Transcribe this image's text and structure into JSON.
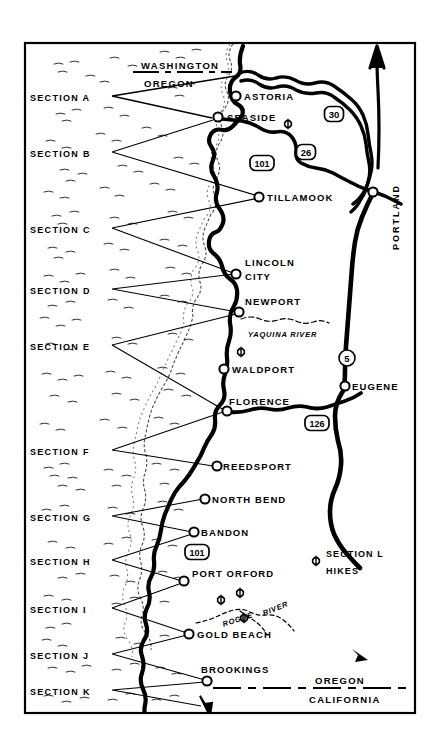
{
  "map": {
    "title": "Oregon Coast Trail Section Map",
    "region": "Oregon Coast",
    "frame": {
      "x": 25,
      "y": 43,
      "width": 390,
      "height": 670
    },
    "colors": {
      "land": "#ffffff",
      "ocean": "#ffffff",
      "highway": "#000000",
      "frame": "#000000",
      "text": "#000000"
    }
  },
  "sections": [
    {
      "id": "A",
      "label": "SECTION A",
      "x": 30,
      "y": 99,
      "leader_to": [
        [
          235,
          76
        ],
        [
          212,
          118
        ]
      ]
    },
    {
      "id": "B",
      "label": "SECTION B",
      "x": 30,
      "y": 155,
      "leader_to": [
        [
          213,
          120
        ],
        [
          258,
          196
        ]
      ]
    },
    {
      "id": "C",
      "label": "SECTION C",
      "x": 30,
      "y": 231,
      "leader_to": [
        [
          259,
          198
        ],
        [
          233,
          273
        ]
      ]
    },
    {
      "id": "D",
      "label": "SECTION D",
      "x": 30,
      "y": 292,
      "leader_to": [
        [
          234,
          274
        ],
        [
          237,
          312
        ]
      ]
    },
    {
      "id": "E",
      "label": "SECTION E",
      "x": 30,
      "y": 348,
      "leader_to": [
        [
          236,
          314
        ],
        [
          224,
          410
        ]
      ]
    },
    {
      "id": "F",
      "label": "SECTION F",
      "x": 30,
      "y": 453,
      "leader_to": [
        [
          223,
          412
        ],
        [
          213,
          466
        ]
      ]
    },
    {
      "id": "G",
      "label": "SECTION G",
      "x": 30,
      "y": 519,
      "leader_to": [
        [
          203,
          499
        ],
        [
          192,
          532
        ]
      ]
    },
    {
      "id": "H",
      "label": "SECTION H",
      "x": 30,
      "y": 563,
      "leader_to": [
        [
          192,
          534
        ],
        [
          182,
          581
        ]
      ]
    },
    {
      "id": "I",
      "label": "SECTION I",
      "x": 30,
      "y": 611,
      "leader_to": [
        [
          182,
          583
        ],
        [
          187,
          633
        ]
      ]
    },
    {
      "id": "J",
      "label": "SECTION J",
      "x": 30,
      "y": 657,
      "leader_to": [
        [
          187,
          635
        ],
        [
          205,
          680
        ]
      ]
    },
    {
      "id": "K",
      "label": "SECTION K",
      "x": 30,
      "y": 693,
      "leader_to": [
        [
          205,
          682
        ],
        [
          201,
          706
        ]
      ]
    }
  ],
  "cities": [
    {
      "name": "ASTORIA",
      "dot": [
        236,
        96
      ],
      "label_x": 244,
      "label_y": 91
    },
    {
      "name": "SEASIDE",
      "dot": [
        218,
        117
      ],
      "label_x": 227,
      "label_y": 112
    },
    {
      "name": "TILLAMOOK",
      "dot": [
        259,
        197
      ],
      "label_x": 267,
      "label_y": 192
    },
    {
      "name": "LINCOLN",
      "dot": [
        236,
        274
      ],
      "label_x": 245,
      "label_y": 257
    },
    {
      "name": "CITY",
      "dot": null,
      "label_x": 245,
      "label_y": 271
    },
    {
      "name": "NEWPORT",
      "dot": [
        239,
        312
      ],
      "label_x": 245,
      "label_y": 296
    },
    {
      "name": "WALDPORT",
      "dot": [
        224,
        369
      ],
      "label_x": 232,
      "label_y": 364
    },
    {
      "name": "FLORENCE",
      "dot": [
        227,
        411
      ],
      "label_x": 229,
      "label_y": 396
    },
    {
      "name": "REEDSPORT",
      "dot": [
        217,
        466
      ],
      "label_x": 223,
      "label_y": 461
    },
    {
      "name": "NORTH BEND",
      "dot": [
        205,
        499
      ],
      "label_x": 212,
      "label_y": 494
    },
    {
      "name": "BANDON",
      "dot": [
        194,
        532
      ],
      "label_x": 201,
      "label_y": 527
    },
    {
      "name": "PORT ORFORD",
      "dot": [
        184,
        581
      ],
      "label_x": 192,
      "label_y": 568
    },
    {
      "name": "GOLD BEACH",
      "dot": [
        189,
        634
      ],
      "label_x": 197,
      "label_y": 629
    },
    {
      "name": "BROOKINGS",
      "dot": [
        207,
        681
      ],
      "label_x": 201,
      "label_y": 664
    },
    {
      "name": "PORTLAND",
      "dot": [
        373,
        192
      ],
      "label_x": 0,
      "label_y": 0
    },
    {
      "name": "EUGENE",
      "dot": [
        345,
        386
      ],
      "label_x": 352,
      "label_y": 381
    }
  ],
  "rotated_labels": [
    {
      "text": "PORTLAND",
      "x": 391,
      "y": 250
    }
  ],
  "highway_shields": [
    {
      "route": "30",
      "type": "us",
      "x": 334,
      "y": 114
    },
    {
      "route": "26",
      "type": "us",
      "x": 306,
      "y": 152
    },
    {
      "route": "101",
      "type": "us",
      "x": 262,
      "y": 163,
      "wide": true
    },
    {
      "route": "5",
      "type": "interstate",
      "x": 347,
      "y": 358
    },
    {
      "route": "126",
      "type": "us",
      "x": 317,
      "y": 423,
      "wide": true
    },
    {
      "route": "101",
      "type": "us",
      "x": 197,
      "y": 552,
      "wide": true
    }
  ],
  "state_borders": [
    {
      "upper": "WASHINGTON",
      "lower": "OREGON",
      "upper_x": 141,
      "upper_y": 60,
      "lower_x": 144,
      "lower_y": 78,
      "line_y": 72,
      "line_x1": 133,
      "line_x2": 232
    },
    {
      "upper": "OREGON",
      "lower": "CALIFORNIA",
      "upper_x": 315,
      "upper_y": 675,
      "lower_x": 309,
      "lower_y": 694,
      "line_y": 688,
      "line_x1": 213,
      "line_x2": 412
    }
  ],
  "rivers": [
    {
      "name": "YAQUINA RIVER",
      "label_x": 248,
      "label_y": 330
    },
    {
      "name": "ROGUE",
      "label_x": 222,
      "label_y": 615,
      "rotate": -18
    },
    {
      "name": "RIVER",
      "label_x": 262,
      "label_y": 604,
      "rotate": -22
    }
  ],
  "legend": {
    "marker_x": 316,
    "marker_y": 561,
    "line1": "SECTION L",
    "line2": "HIKES",
    "line1_x": 326,
    "line1_y": 555,
    "line2_x": 326,
    "line2_y": 572
  },
  "hike_markers": [
    {
      "x": 288,
      "y": 124
    },
    {
      "x": 241,
      "y": 352
    },
    {
      "x": 221,
      "y": 600
    },
    {
      "x": 240,
      "y": 593
    },
    {
      "x": 244,
      "y": 618
    }
  ]
}
